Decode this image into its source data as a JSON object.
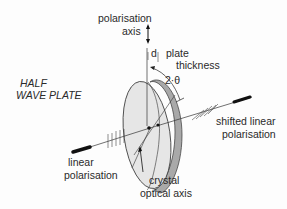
{
  "title": "HALF WAVE PLATE",
  "title_lines": [
    "HALF",
    "WAVE  PLATE"
  ],
  "labels": {
    "polarisation_axis_line1": "polarisation",
    "polarisation_axis_line2": "axis",
    "d": "d",
    "plate_thickness_line1": "plate",
    "plate_thickness_line2": "thickness",
    "angle": "2·θ",
    "shifted_line1": "shifted linear",
    "shifted_line2": "polarisation",
    "linear_line1": "linear",
    "linear_line2": "polarisation",
    "crystal_line1": "crystal",
    "crystal_line2": "optical axis"
  },
  "colors": {
    "plate_face": "#e4e4e4",
    "plate_edge": "#a9a9a9",
    "ink": "#222222"
  }
}
